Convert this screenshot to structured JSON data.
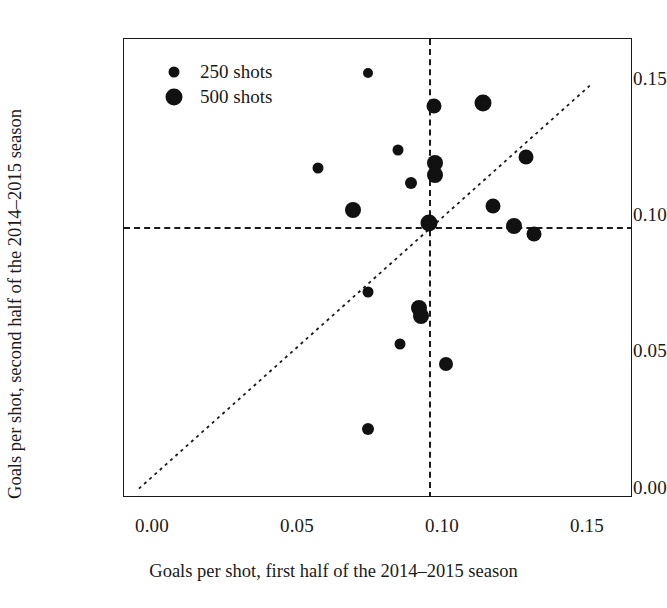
{
  "chart_data": {
    "type": "scatter",
    "title": "",
    "xlabel": "Goals per shot, first half of the 2014–2015 season",
    "ylabel": "Goals per shot, second half of the 2014–2015 season",
    "xlim": [
      -0.005,
      0.1655
    ],
    "ylim": [
      -0.0035,
      0.1685
    ],
    "xticks": [
      0.0,
      0.05,
      0.1,
      0.15
    ],
    "yticks": [
      0.0,
      0.05,
      0.1,
      0.15
    ],
    "xticklabels": [
      "0.00",
      "0.05",
      "0.10",
      "0.15"
    ],
    "yticklabels": [
      "0.00",
      "0.05",
      "0.10",
      "0.15"
    ],
    "grid": false,
    "legend": {
      "position": "top-left",
      "entries": [
        {
          "label": "250 shots",
          "marker_size_px": 9,
          "marker_color": "#111111"
        },
        {
          "label": "500 shots",
          "marker_size_px": 15,
          "marker_color": "#111111"
        }
      ]
    },
    "reference_lines": [
      {
        "name": "mean-vertical",
        "orientation": "vertical",
        "value": 0.0972,
        "style": "dashed"
      },
      {
        "name": "mean-horizontal",
        "orientation": "horizontal",
        "value": 0.0982,
        "style": "dashed"
      },
      {
        "name": "identity-diagonal",
        "orientation": "diagonal",
        "from": [
          0.0,
          0.0
        ],
        "to": [
          0.151,
          0.151
        ],
        "style": "dotted"
      }
    ],
    "series": [
      {
        "name": "players",
        "marker": "filled-circle",
        "color": "#111111",
        "size_encodes": "shots attempted",
        "points": [
          {
            "x": 0.0766,
            "y": 0.1556,
            "size": 10
          },
          {
            "x": 0.0988,
            "y": 0.1434,
            "size": 15
          },
          {
            "x": 0.1152,
            "y": 0.1446,
            "size": 17
          },
          {
            "x": 0.0869,
            "y": 0.1268,
            "size": 11
          },
          {
            "x": 0.1297,
            "y": 0.1243,
            "size": 15
          },
          {
            "x": 0.0993,
            "y": 0.1219,
            "size": 16
          },
          {
            "x": 0.0993,
            "y": 0.1175,
            "size": 16
          },
          {
            "x": 0.06,
            "y": 0.1203,
            "size": 11
          },
          {
            "x": 0.091,
            "y": 0.1144,
            "size": 12
          },
          {
            "x": 0.1186,
            "y": 0.1059,
            "size": 15
          },
          {
            "x": 0.0717,
            "y": 0.1045,
            "size": 16
          },
          {
            "x": 0.0972,
            "y": 0.0996,
            "size": 17
          },
          {
            "x": 0.1255,
            "y": 0.0985,
            "size": 16
          },
          {
            "x": 0.1324,
            "y": 0.0956,
            "size": 15
          },
          {
            "x": 0.0766,
            "y": 0.0737,
            "size": 11
          },
          {
            "x": 0.0938,
            "y": 0.0678,
            "size": 16
          },
          {
            "x": 0.0945,
            "y": 0.0648,
            "size": 16
          },
          {
            "x": 0.0876,
            "y": 0.0542,
            "size": 11
          },
          {
            "x": 0.1028,
            "y": 0.0469,
            "size": 14
          },
          {
            "x": 0.0766,
            "y": 0.0223,
            "size": 12
          }
        ]
      }
    ]
  }
}
